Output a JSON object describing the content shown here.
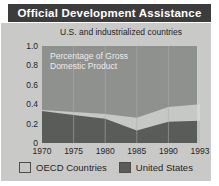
{
  "title_bar": {
    "title": "Official Development Assistance"
  },
  "chart_data": {
    "type": "area",
    "title": "Official Development Assistance",
    "subtitle": "U.S. and industrialized countries",
    "annotation": "Percentage of Gross Domestic Product",
    "annotation_lines": {
      "line1": "Percentage of Gross",
      "line2": "Domestic Product"
    },
    "categories": [
      "1970",
      "1975",
      "1980",
      "1985",
      "1990",
      "1993"
    ],
    "series": [
      {
        "name": "OECD Countries",
        "values": [
          0.34,
          0.32,
          0.3,
          0.26,
          0.37,
          0.4
        ],
        "color": "#c6c8c5"
      },
      {
        "name": "United States",
        "values": [
          0.33,
          0.29,
          0.25,
          0.13,
          0.22,
          0.23
        ],
        "color": "#5a5c5a"
      }
    ],
    "ylim": [
      0,
      1.0
    ],
    "yticks": [
      "1.0",
      "0.8",
      "0.6",
      "0.4",
      "0.2",
      "0"
    ],
    "grid": "vertical-only",
    "legend_position": "bottom",
    "plot_bg": "#8f918f",
    "panel_bg": "#c9cac8",
    "title_bg": "#3c3c3c",
    "gridline_color": "#adafad",
    "right_edge_highlight": "#d8dad8"
  },
  "legend": {
    "items": [
      {
        "label": "OECD Countries",
        "color": "#c6c8c5"
      },
      {
        "label": "United States",
        "color": "#5a5c5a"
      }
    ]
  }
}
